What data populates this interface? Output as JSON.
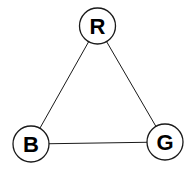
{
  "graph": {
    "nodes": [
      {
        "id": "R",
        "label": "R",
        "cx": 97.5,
        "cy": 26,
        "r": 18
      },
      {
        "id": "B",
        "label": "B",
        "cx": 31,
        "cy": 144,
        "r": 18
      },
      {
        "id": "G",
        "label": "G",
        "cx": 165,
        "cy": 142,
        "r": 18
      }
    ],
    "edges": [
      {
        "from": "R",
        "to": "B"
      },
      {
        "from": "R",
        "to": "G"
      },
      {
        "from": "B",
        "to": "G"
      }
    ],
    "colors": {
      "stroke": "#1a1a1a",
      "fill": "#ffffff",
      "text": "#000000"
    }
  }
}
